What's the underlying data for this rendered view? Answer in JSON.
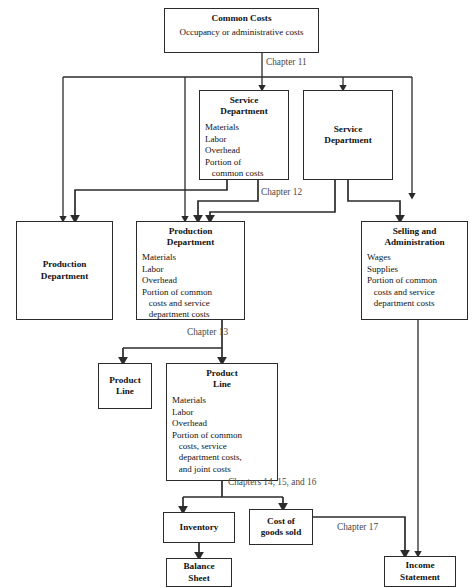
{
  "diagram": {
    "line_color": "#2b2b2b",
    "label_color": "#4a4a4a",
    "text_color": "#121212"
  },
  "boxes": {
    "common_costs": {
      "title": "Common Costs",
      "subtitle": "Occupancy or administrative costs"
    },
    "service_dept_detail": {
      "title_line1": "Service",
      "title_line2": "Department",
      "items": [
        "Materials",
        "Labor",
        "Overhead",
        "Portion of",
        "   common costs"
      ]
    },
    "service_dept_plain": {
      "title_line1": "Service",
      "title_line2": "Department"
    },
    "production_dept_plain": {
      "title_line1": "Production",
      "title_line2": "Department"
    },
    "production_dept_detail": {
      "title_line1": "Production",
      "title_line2": "Department",
      "items": [
        "Materials",
        "Labor",
        "Overhead",
        "Portion of common",
        "   costs and service",
        "   department costs"
      ]
    },
    "selling_admin": {
      "title_line1": "Selling and",
      "title_line2": "Administration",
      "items": [
        "Wages",
        "Supplies",
        "Portion of common",
        "   costs and service",
        "   department costs"
      ]
    },
    "product_line_plain": {
      "title_line1": "Product",
      "title_line2": "Line"
    },
    "product_line_detail": {
      "title_line1": "Product",
      "title_line2": "Line",
      "items": [
        "Materials",
        "Labor",
        "Overhead",
        "Portion of common",
        "   costs, service",
        "   department costs,",
        "   and joint costs"
      ]
    },
    "inventory": {
      "title": "Inventory"
    },
    "cost_of_goods_sold": {
      "title_line1": "Cost of",
      "title_line2": "goods sold"
    },
    "balance_sheet": {
      "title_line1": "Balance",
      "title_line2": "Sheet"
    },
    "income_statement": {
      "title_line1": "Income",
      "title_line2": "Statement"
    }
  },
  "labels": {
    "chapter11": "Chapter 11",
    "chapter12": "Chapter 12",
    "chapter13": "Chapter 13",
    "chapters14_16": "Chapters 14, 15, and 16",
    "chapter17": "Chapter 17"
  }
}
